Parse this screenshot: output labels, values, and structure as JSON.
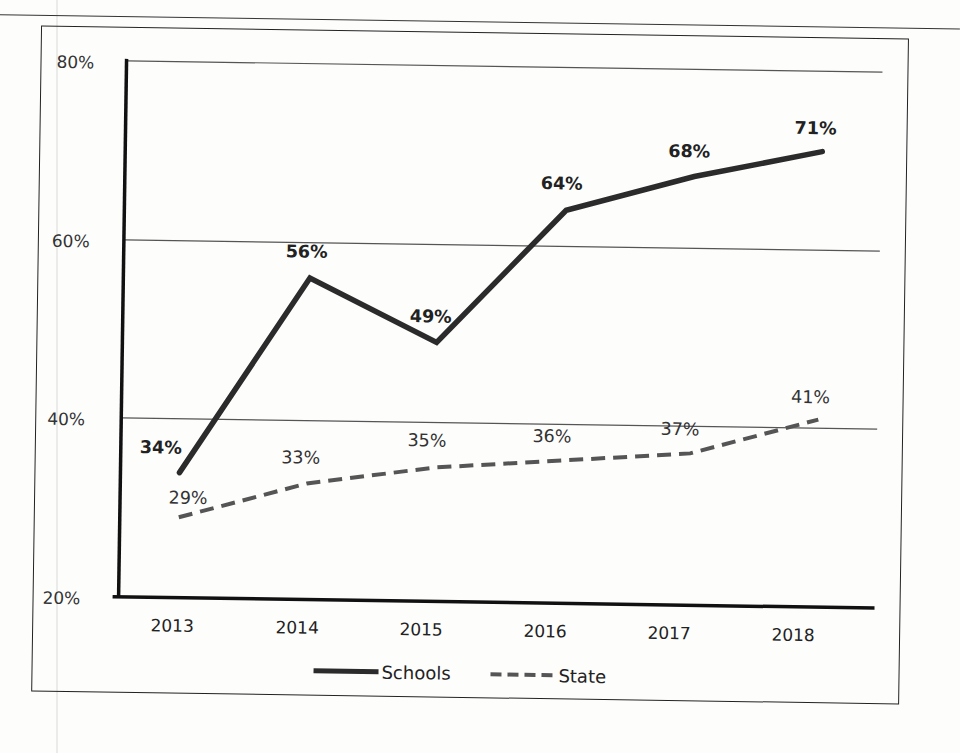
{
  "chart_data": {
    "type": "line",
    "title": "",
    "xlabel": "",
    "ylabel": "",
    "categories": [
      "2013",
      "2014",
      "2015",
      "2016",
      "2017",
      "2018"
    ],
    "series": [
      {
        "name": "Schools",
        "style": "solid",
        "color": "#2b2b2b",
        "values": [
          34,
          56,
          49,
          64,
          68,
          71
        ],
        "labels": [
          "34%",
          "56%",
          "49%",
          "64%",
          "68%",
          "71%"
        ]
      },
      {
        "name": "State",
        "style": "dashed",
        "color": "#555555",
        "values": [
          29,
          33,
          35,
          36,
          37,
          41
        ],
        "labels": [
          "29%",
          "33%",
          "35%",
          "36%",
          "37%",
          "41%"
        ]
      }
    ],
    "ylim": [
      20,
      80
    ],
    "yticks": [
      "20%",
      "40%",
      "60%",
      "80%"
    ],
    "grid": true,
    "legend_position": "bottom"
  },
  "axis": {
    "y_ticks": {
      "t20": "20%",
      "t40": "40%",
      "t60": "60%",
      "t80": "80%"
    },
    "x_ticks": [
      "2013",
      "2014",
      "2015",
      "2016",
      "2017",
      "2018"
    ]
  },
  "legend": {
    "schools": "Schools",
    "state": "State"
  },
  "colors": {
    "schools_line": "#2b2b2b",
    "state_line": "#555555",
    "grid": "#555555",
    "axis": "#111111"
  }
}
